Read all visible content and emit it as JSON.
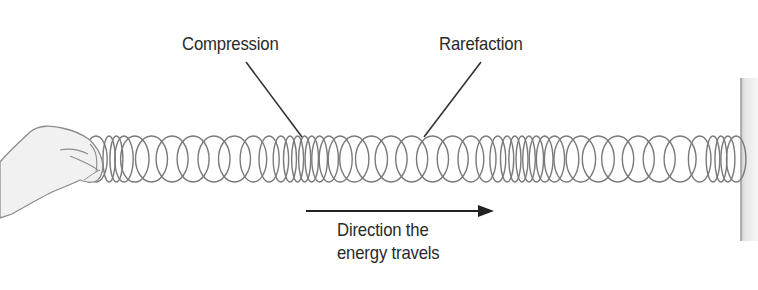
{
  "labels": {
    "compression": "Compression",
    "rarefaction": "Rarefaction",
    "direction_line1": "Direction the",
    "direction_line2": "energy travels"
  },
  "colors": {
    "coil": "#7a7a7a",
    "text": "#2a2a2a",
    "leader_line": "#333333",
    "arrow": "#222222",
    "hand_fill": "#f1f1f1",
    "hand_stroke": "#8c8c8c",
    "wall_light": "#f2f2f2",
    "wall_dark": "#cfcfcf"
  },
  "spring": {
    "x_start": 96,
    "x_end": 742,
    "y_center": 159,
    "radius_y": 23,
    "compressed_regions": [
      {
        "center": 112,
        "half_width": 20
      },
      {
        "center": 300,
        "half_width": 45
      },
      {
        "center": 520,
        "half_width": 50
      },
      {
        "center": 720,
        "half_width": 25
      }
    ],
    "min_spacing": 7,
    "max_spacing": 21
  },
  "leaders": [
    {
      "name": "compression-leader",
      "x1": 246,
      "y1": 62,
      "x2": 302,
      "y2": 137
    },
    {
      "name": "rarefaction-leader",
      "x1": 481,
      "y1": 62,
      "x2": 424,
      "y2": 137
    }
  ],
  "arrow": {
    "x1": 306,
    "x2": 494,
    "y": 211
  }
}
